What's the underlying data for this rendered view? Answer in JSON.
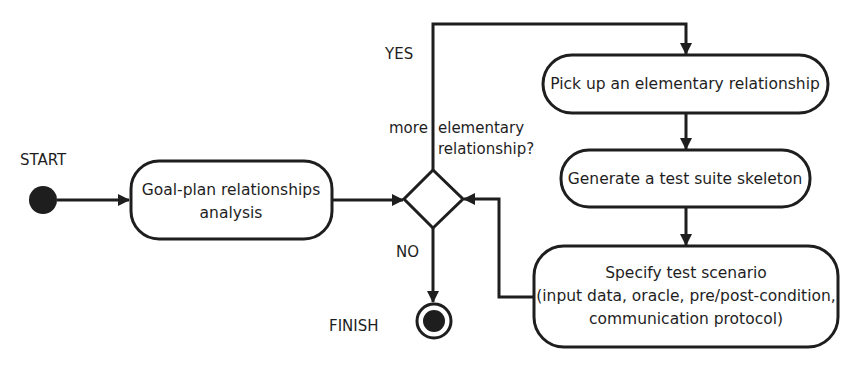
{
  "diagram": {
    "type": "activity-diagram",
    "colors": {
      "stroke": "#1e1e1e",
      "fill": "#ffffff",
      "text": "#1e1e1e"
    },
    "start": {
      "label": "START"
    },
    "finish": {
      "label": "FINISH"
    },
    "nodes": {
      "analysis": {
        "lines": [
          "Goal-plan relationships",
          "analysis"
        ]
      },
      "pick": {
        "lines": [
          "Pick up an elementary relationship"
        ]
      },
      "generate": {
        "lines": [
          "Generate a test suite skeleton"
        ]
      },
      "specify": {
        "lines": [
          "Specify test scenario",
          "(input data, oracle, pre/post-condition,",
          "communication protocol)"
        ]
      }
    },
    "decision": {
      "question_left": "more",
      "question_right_line1": "elementary",
      "question_right_line2": "relationship?",
      "yes_label": "YES",
      "no_label": "NO"
    },
    "edges": [
      {
        "from": "start",
        "to": "analysis"
      },
      {
        "from": "analysis",
        "to": "decision"
      },
      {
        "from": "decision",
        "to": "pick",
        "label": "YES"
      },
      {
        "from": "pick",
        "to": "generate"
      },
      {
        "from": "generate",
        "to": "specify"
      },
      {
        "from": "specify",
        "to": "decision"
      },
      {
        "from": "decision",
        "to": "finish",
        "label": "NO"
      }
    ]
  }
}
